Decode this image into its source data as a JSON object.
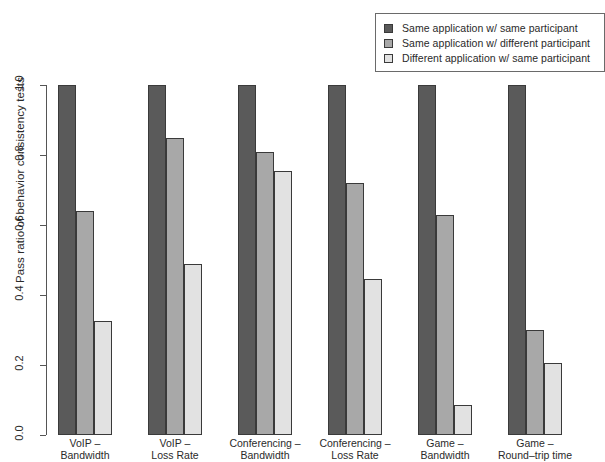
{
  "chart_data": {
    "type": "bar",
    "title": "",
    "subtitle": "",
    "xlabel": "",
    "ylabel": "Pass ratio of behavior consistency tests",
    "ylim": [
      0.0,
      1.0
    ],
    "yticks": [
      "0.0",
      "0.2",
      "0.4",
      "0.6",
      "0.8",
      "1.0"
    ],
    "ytick_values": [
      0.0,
      0.2,
      0.4,
      0.6,
      0.8,
      1.0
    ],
    "grid": false,
    "legend_position": "top-right",
    "categories": [
      "VoIP - Bandwidth",
      "VoIP - Loss Rate",
      "Conferencing - Bandwidth",
      "Conferencing - Loss Rate",
      "Game - Bandwidth",
      "Game - Round-trip time"
    ],
    "category_lines": [
      [
        "VoIP –",
        "Bandwidth"
      ],
      [
        "VoIP –",
        "Loss Rate"
      ],
      [
        "Conferencing –",
        "Bandwidth"
      ],
      [
        "Conferencing –",
        "Loss Rate"
      ],
      [
        "Game –",
        "Bandwidth"
      ],
      [
        "Game –",
        "Round–trip time"
      ]
    ],
    "series": [
      {
        "name": "Same application w/ same participant",
        "color": "#5a5a5a",
        "values": [
          1.0,
          1.0,
          1.0,
          1.0,
          1.0,
          1.0
        ]
      },
      {
        "name": "Same application w/ different participant",
        "color": "#a8a8a8",
        "values": [
          0.64,
          0.85,
          0.81,
          0.72,
          0.63,
          0.3
        ]
      },
      {
        "name": "Different application w/ same participant",
        "color": "#e2e2e2",
        "values": [
          0.325,
          0.49,
          0.755,
          0.445,
          0.085,
          0.205
        ]
      }
    ]
  },
  "legend": {
    "items": [
      {
        "label": "Same application w/ same participant",
        "color": "#5a5a5a"
      },
      {
        "label": "Same application w/ different participant",
        "color": "#a8a8a8"
      },
      {
        "label": "Different application w/ same participant",
        "color": "#e2e2e2"
      }
    ]
  },
  "axis": {
    "y_title": "Pass ratio of behavior consistency tests"
  }
}
